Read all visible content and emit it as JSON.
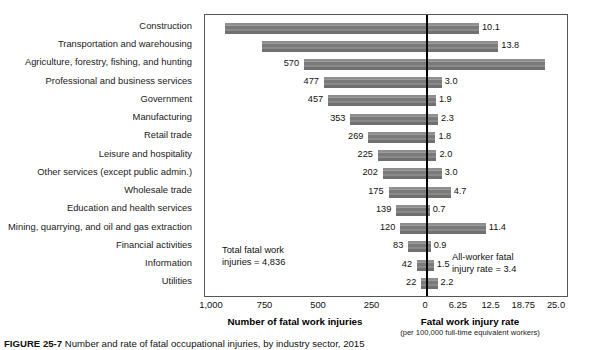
{
  "chart_data": {
    "type": "bar",
    "orientation": "horizontal",
    "title": "Number and rate of fatal occupational injuries, by industry sector, 2015",
    "categories": [
      "Construction",
      "Transportation and warehousing",
      "Agriculture, forestry, fishing, and hunting",
      "Professional and business services",
      "Government",
      "Manufacturing",
      "Retail trade",
      "Leisure and hospitality",
      "Other services (except public admin.)",
      "Wholesale trade",
      "Education and health services",
      "Mining, quarrying, and oil and gas extraction",
      "Financial activities",
      "Information",
      "Utilities"
    ],
    "series": [
      {
        "name": "Number of fatal work injuries",
        "axis": "left",
        "values": [
          937,
          765,
          570,
          477,
          457,
          353,
          269,
          225,
          202,
          175,
          139,
          120,
          83,
          42,
          22
        ],
        "labels": [
          "",
          "",
          "570",
          "477",
          "457",
          "353",
          "269",
          "225",
          "202",
          "175",
          "139",
          "120",
          "83",
          "42",
          "22"
        ]
      },
      {
        "name": "Fatal work injury rate",
        "axis": "right",
        "values": [
          10.1,
          13.8,
          22.8,
          3.0,
          1.9,
          2.3,
          1.8,
          2.0,
          3.0,
          4.7,
          0.7,
          11.4,
          0.9,
          1.5,
          2.2
        ],
        "labels": [
          "10.1",
          "13.8",
          "",
          "3.0",
          "1.9",
          "2.3",
          "1.8",
          "2.0",
          "3.0",
          "4.7",
          "0.7",
          "11.4",
          "0.9",
          "1.5",
          "2.2"
        ]
      }
    ],
    "left_axis": {
      "title": "Number of fatal work injuries",
      "ticks": [
        "1,000",
        "750",
        "500",
        "250",
        "0"
      ],
      "tick_values": [
        1000,
        750,
        500,
        250,
        0
      ],
      "range": [
        1000,
        0
      ],
      "direction": "reversed"
    },
    "right_axis": {
      "title": "Fatal work injury rate",
      "subtitle": "(per 100,000 full-time equivalent workers)",
      "ticks": [
        "0",
        "6.25",
        "12.5",
        "18.75",
        "25.0"
      ],
      "tick_values": [
        0,
        6.25,
        12.5,
        18.75,
        25.0
      ],
      "range": [
        0,
        25.0
      ]
    },
    "annotations": [
      {
        "id": "total-injuries",
        "line1": "Total fatal work",
        "line2": "injuries = 4,836"
      },
      {
        "id": "all-worker-rate",
        "line1": "All-worker fatal",
        "line2": "injury rate = 3.4"
      }
    ],
    "grid": false,
    "legend": "none",
    "bar_color": "#808080",
    "zero_line_color": "#000000"
  },
  "caption": {
    "figure_number": "FIGURE 25-7",
    "text": "Number and rate of fatal occupational injuries, by industry sector, 2015"
  }
}
